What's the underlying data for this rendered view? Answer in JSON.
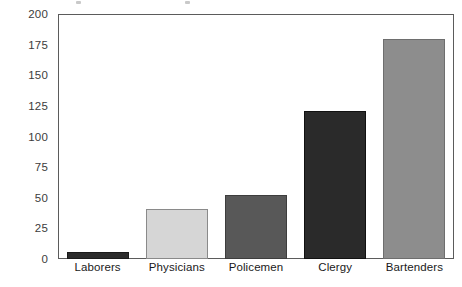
{
  "chart_data": {
    "type": "bar",
    "title": "",
    "xlabel": "",
    "ylabel": "",
    "categories": [
      "Laborers",
      "Physicians",
      "Policemen",
      "Clergy",
      "Bartenders"
    ],
    "values": [
      6,
      41,
      52,
      121,
      180
    ],
    "ylim": [
      0,
      200
    ],
    "yticks": [
      0,
      25,
      50,
      75,
      100,
      125,
      150,
      175,
      200
    ],
    "ytick_labels": [
      "0",
      "25",
      "50",
      "75",
      "100",
      "125",
      "150",
      "175",
      "200"
    ],
    "grid": false,
    "legend": "none",
    "bar_colors": [
      "#2b2b2b",
      "#d6d6d6",
      "#585858",
      "#2a2a2a",
      "#8d8d8d"
    ],
    "bar_edge_colors": [
      "#1a1a1a",
      "#8a8a8a",
      "#3d3d3d",
      "#111111",
      "#6e6e6e"
    ],
    "axis_color": "#5b5b5b",
    "background_color": "#ffffff"
  },
  "axis": {
    "tick_0": "0",
    "tick_25": "25",
    "tick_50": "50",
    "tick_75": "75",
    "tick_100": "100",
    "tick_125": "125",
    "tick_150": "150",
    "tick_175": "175",
    "tick_200": "200"
  },
  "categories": {
    "cat_0": "Laborers",
    "cat_1": "Physicians",
    "cat_2": "Policemen",
    "cat_3": "Clergy",
    "cat_4": "Bartenders"
  }
}
